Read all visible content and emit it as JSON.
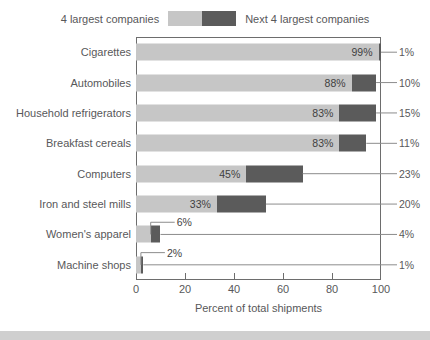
{
  "legend": {
    "left_label": "4 largest companies",
    "right_label": "Next 4 largest companies",
    "light_swatch_name": "4-largest-companies-swatch",
    "dark_swatch_name": "next-4-largest-companies-swatch"
  },
  "axis": {
    "xlabel": "Percent of total shipments",
    "tick_labels": [
      "0",
      "20",
      "40",
      "60",
      "80",
      "100"
    ]
  },
  "colors": {
    "light_bar": "#c6c6c6",
    "dark_bar": "#5b5b5b",
    "frame": "#6d6d6d",
    "text": "#58585a",
    "bottom_band": "#cfcfcf",
    "background": "#ffffff"
  },
  "chart_data": {
    "type": "bar",
    "orientation": "horizontal",
    "stacked": true,
    "title": "",
    "xlabel": "Percent of total shipments",
    "ylabel": "",
    "xlim": [
      0,
      100
    ],
    "xticks": [
      0,
      20,
      40,
      60,
      80,
      100
    ],
    "grid": false,
    "legend_position": "top-center",
    "categories": [
      "Cigarettes",
      "Automobiles",
      "Household refrigerators",
      "Breakfast cereals",
      "Computers",
      "Iron and steel mills",
      "Women's apparel",
      "Machine shops"
    ],
    "series": [
      {
        "name": "4 largest companies",
        "color": "#c6c6c6",
        "values": [
          99,
          88,
          83,
          83,
          45,
          33,
          6,
          2
        ],
        "labels": [
          "99%",
          "88%",
          "83%",
          "83%",
          "45%",
          "33%",
          "6%",
          "2%"
        ]
      },
      {
        "name": "Next 4 largest companies",
        "color": "#5b5b5b",
        "values": [
          1,
          10,
          15,
          11,
          23,
          20,
          4,
          1
        ],
        "labels": [
          "1%",
          "10%",
          "15%",
          "11%",
          "23%",
          "20%",
          "4%",
          "1%"
        ]
      }
    ]
  }
}
